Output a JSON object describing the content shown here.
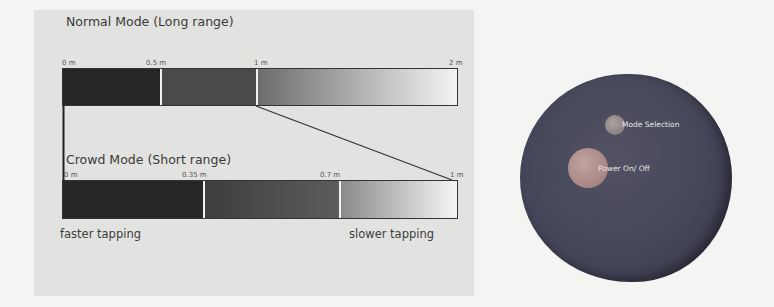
{
  "diagram": {
    "normal_mode": {
      "title": "Normal Mode (Long range)",
      "ticks": [
        "0 m",
        "0.5 m",
        "1 m",
        "2 m"
      ],
      "segments": [
        {
          "from": 0,
          "to": 0.5,
          "color": "#262626"
        },
        {
          "from": 0.5,
          "to": 1,
          "color": "#474747"
        },
        {
          "from": 1,
          "to": 2,
          "gradient": [
            "#707070",
            "#f4f4f4"
          ]
        }
      ]
    },
    "crowd_mode": {
      "title": "Crowd Mode (Short range)",
      "ticks": [
        "0 m",
        "0.35 m",
        "0.7 m",
        "1 m"
      ],
      "segments": [
        {
          "from": 0,
          "to": 0.35,
          "color": "#262626"
        },
        {
          "from": 0.35,
          "to": 0.7,
          "color": "#4c4c4c"
        },
        {
          "from": 0.7,
          "to": 1,
          "gradient": [
            "#858585",
            "#f4f4f4"
          ]
        }
      ]
    },
    "captions": {
      "left": "faster tapping",
      "right": "slower tapping"
    }
  },
  "device": {
    "mode_button_label": "Mode Selection",
    "power_button_label": "Power On/ Off",
    "body_color": "#46465a"
  }
}
